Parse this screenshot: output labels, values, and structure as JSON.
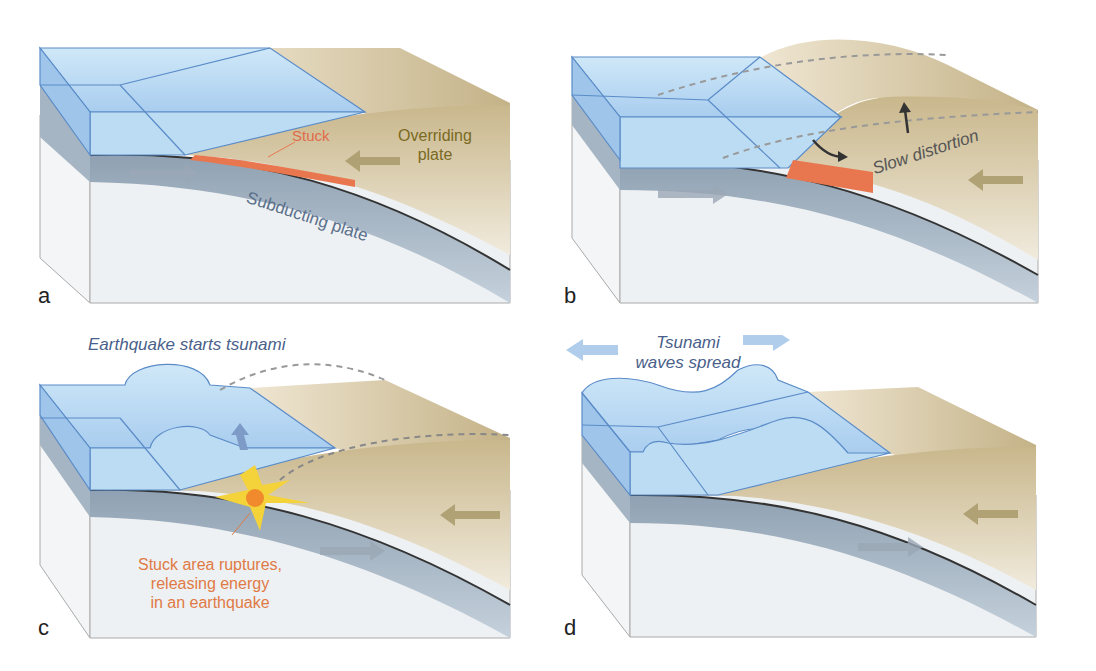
{
  "figure": {
    "panels": [
      {
        "letter": "a",
        "labels": {
          "stuck": "Stuck",
          "overriding": "Overriding",
          "overriding2": "plate",
          "subducting": "Subducting plate"
        }
      },
      {
        "letter": "b",
        "labels": {
          "slow": "Slow distortion"
        }
      },
      {
        "letter": "c",
        "labels": {
          "caption": "Earthquake starts tsunami",
          "rupture1": "Stuck area ruptures,",
          "rupture2": "releasing energy",
          "rupture3": "in an earthquake"
        }
      },
      {
        "letter": "d",
        "labels": {
          "caption1": "Tsunami",
          "caption2": "waves spread"
        }
      }
    ],
    "colors": {
      "water": "#bfe0f5",
      "water_edge": "#5b8cc8",
      "land": "#d8c9a3",
      "land_dark": "#b4a174",
      "plate": "#a9b8c6",
      "mantle": "#eef1f3",
      "stuck_zone": "#e8774f",
      "label_blue": "#4a5f8a",
      "label_orange": "#e07a45",
      "label_olive": "#7a6a1f"
    }
  }
}
